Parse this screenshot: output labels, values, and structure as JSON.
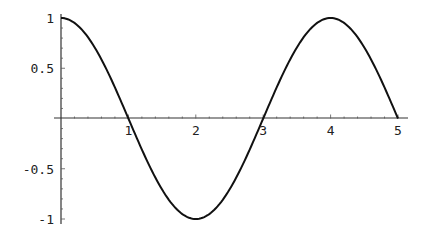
{
  "chart_data": {
    "type": "line",
    "title": "",
    "xlabel": "",
    "ylabel": "",
    "xlim": [
      0,
      5
    ],
    "ylim": [
      -1,
      1
    ],
    "grid": false,
    "legend": null,
    "function": "cos(pi*x/2)",
    "x_ticks": [
      "1",
      "2",
      "3",
      "4",
      "5"
    ],
    "y_ticks": [
      "1",
      "0.5",
      "-0.5",
      "-1"
    ],
    "series": [
      {
        "name": "cos(πx/2)",
        "x": [
          0,
          0.25,
          0.5,
          0.75,
          1,
          1.25,
          1.5,
          1.75,
          2,
          2.25,
          2.5,
          2.75,
          3,
          3.25,
          3.5,
          3.75,
          4,
          4.25,
          4.5,
          4.75,
          5
        ],
        "values": [
          1,
          0.924,
          0.707,
          0.383,
          0,
          -0.383,
          -0.707,
          -0.924,
          -1,
          -0.924,
          -0.707,
          -0.383,
          0,
          0.383,
          0.707,
          0.924,
          1,
          0.924,
          0.707,
          0.383,
          0
        ]
      }
    ],
    "line_color": "#111111"
  }
}
